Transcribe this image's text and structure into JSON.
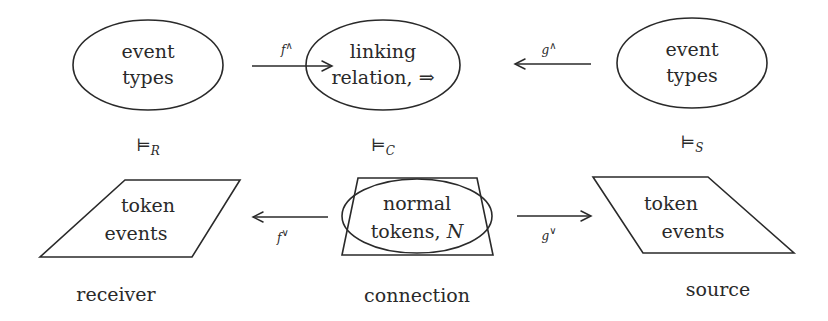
{
  "diagram": {
    "top_row": {
      "receiver_types": {
        "line1": "event",
        "line2": "types"
      },
      "connection_relation": {
        "line1": "linking",
        "line2": "relation, ⇒"
      },
      "source_types": {
        "line1": "event",
        "line2": "types"
      }
    },
    "arrows": {
      "f_up": {
        "base": "f",
        "sup": "∧",
        "direction": "right"
      },
      "g_up": {
        "base": "g",
        "sup": "∧",
        "direction": "left"
      },
      "f_down": {
        "base": "f",
        "sup": "∨",
        "direction": "left"
      },
      "g_down": {
        "base": "g",
        "sup": "∨",
        "direction": "right"
      }
    },
    "satisfaction": {
      "receiver": {
        "symbol": "⊨",
        "sub": "R"
      },
      "connection": {
        "symbol": "⊨",
        "sub": "C"
      },
      "source": {
        "symbol": "⊨",
        "sub": "S"
      }
    },
    "bottom_row": {
      "receiver_tokens": {
        "line1": "token",
        "line2": "events"
      },
      "connection_tokens": {
        "line1": "normal",
        "line2_prefix": "tokens, ",
        "line2_var": "N"
      },
      "source_tokens": {
        "line1": "token",
        "line2": "events"
      }
    },
    "captions": {
      "receiver": "receiver",
      "connection": "connection",
      "source": "source"
    }
  }
}
